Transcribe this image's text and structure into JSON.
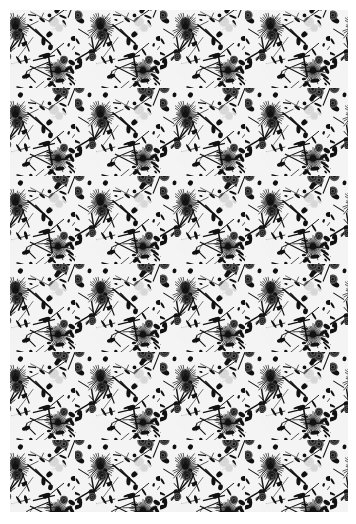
{
  "image": {
    "description": "Black and white dense floral botanical pattern, repeating wallpaper-style print",
    "palette": {
      "background": "#ffffff",
      "ink": "#111111",
      "mid": "#555555",
      "paper": "#f4f4f4"
    },
    "pattern": {
      "tile_width": 85,
      "tile_height": 88,
      "columns": 4,
      "rows": 6,
      "motifs": [
        "starburst-flower",
        "rose",
        "leaf",
        "vine",
        "white-diamond-gap"
      ]
    }
  }
}
